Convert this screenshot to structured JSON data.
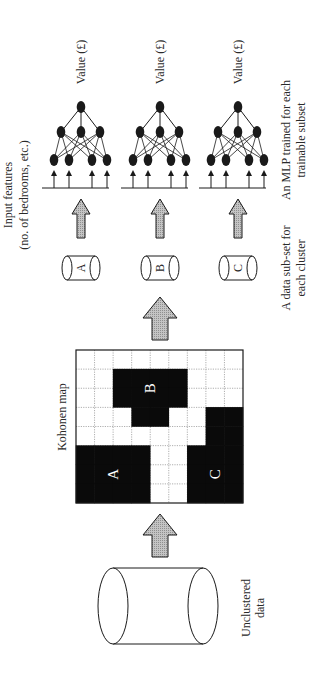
{
  "labels": {
    "input_features_line1": "Input features",
    "input_features_line2": "(no. of bedrooms, etc.)",
    "mlp_output": "Value (£)",
    "mlp_caption_line1": "An MLP trained for each",
    "mlp_caption_line2": "trainable subset",
    "subset_caption_line1": "A data sub-set for",
    "subset_caption_line2": "each cluster",
    "kohonen_map": "Kohonen map",
    "unclustered_line1": "Unclustered",
    "unclustered_line2": "data"
  },
  "clusters": [
    {
      "id": "A",
      "label": "A"
    },
    {
      "id": "B",
      "label": "B"
    },
    {
      "id": "C",
      "label": "C"
    }
  ],
  "kohonen_grid": {
    "cols": 9,
    "rows": 8,
    "cells": [
      "000000000",
      "00BBBB000",
      "00BBBB000",
      "000BB00CC",
      "0000000CC",
      "AAAA00CCC",
      "AAAA00CCC",
      "AAAA00CCC"
    ]
  },
  "mlp": {
    "layers": [
      4,
      3,
      1
    ],
    "inputs": 4
  },
  "colors": {
    "cluster_fill": "#0a0a0a",
    "arrow_fill": "#b5b5b5",
    "line": "#1a1a1a",
    "grid_dotted": "#9a9a9a"
  }
}
